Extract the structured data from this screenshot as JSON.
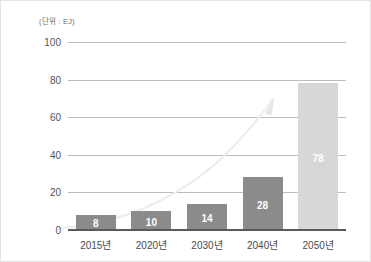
{
  "chart_data": {
    "type": "bar",
    "title": "",
    "unit_label": "(단위 : EJ)",
    "xlabel": "",
    "ylabel": "",
    "categories": [
      "2015년",
      "2020년",
      "2030년",
      "2040년",
      "2050년"
    ],
    "values": [
      8,
      10,
      14,
      28,
      78
    ],
    "value_labels": [
      "8",
      "10",
      "14",
      "28",
      "78"
    ],
    "ylim": [
      0,
      100
    ],
    "yticks": [
      0,
      20,
      40,
      60,
      80,
      100
    ],
    "ytick_labels": [
      "0",
      "20",
      "40",
      "60",
      "80",
      "100"
    ],
    "grid": true,
    "legend": "none",
    "bar_colors": [
      "#8b8b8b",
      "#8b8b8b",
      "#8b8b8b",
      "#8b8b8b",
      "#d7d7d7"
    ],
    "annotations": [
      {
        "name": "growth-trend-arrow",
        "type": "curve-with-arrowhead",
        "color": "#ededed",
        "description": "faint upward exponential curve ending in arrowhead"
      }
    ],
    "colors": {
      "bar_primary": "#8b8b8b",
      "bar_highlight": "#d7d7d7",
      "gridline": "#bcbcbc",
      "axis": "#5a5a5a",
      "tick_text": "#555555",
      "value_text": "#ffffff",
      "background": "#ffffff",
      "border": "#e3e3e3"
    }
  }
}
